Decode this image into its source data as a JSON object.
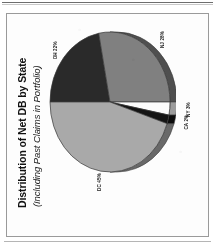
{
  "document": {
    "frame_border_color": "#9a9a9a",
    "background_color": "#ffffff"
  },
  "chart_data": {
    "type": "pie",
    "title": "Distribution of Net DB by State",
    "subtitle": "(Including Past Claims in Portfolio)",
    "xlabel": "",
    "ylabel": "",
    "units": "percent",
    "rotation_degrees": -90,
    "legend": "none (direct slice labels)",
    "categories": [
      "OH",
      "NJ",
      "NY",
      "CA",
      "DC"
    ],
    "values": [
      22,
      28,
      3,
      2,
      45
    ],
    "labels": [
      "OH 22%",
      "NJ 28%",
      "NY 3%",
      "CA 2%",
      "DC 45%"
    ],
    "colors": [
      "#2a2a2a",
      "#808080",
      "#fcfcfc",
      "#141414",
      "#a9a9a9"
    ],
    "slices": [
      {
        "name": "OH",
        "value": 22,
        "label": "OH 22%",
        "color": "#2a2a2a"
      },
      {
        "name": "NJ",
        "value": 28,
        "label": "NJ 28%",
        "color": "#808080"
      },
      {
        "name": "NY",
        "value": 3,
        "label": "NY 3%",
        "color": "#fcfcfc"
      },
      {
        "name": "CA",
        "value": 2,
        "label": "CA 2%",
        "color": "#141414"
      },
      {
        "name": "DC",
        "value": 45,
        "label": "DC 45%",
        "color": "#a9a9a9"
      }
    ]
  }
}
